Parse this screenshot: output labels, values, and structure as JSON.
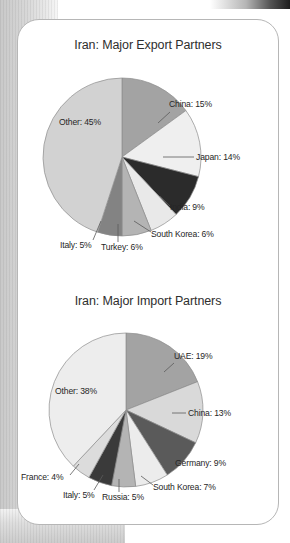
{
  "document": {
    "card_label": "charts-card"
  },
  "charts": [
    {
      "id": "export",
      "title": "Iran: Major Export Partners",
      "chart_data": {
        "type": "pie",
        "title": "Iran: Major Export Partners",
        "xlabel": "",
        "ylabel": "",
        "legend_position": "callout-labels",
        "grid": false,
        "categories": [
          "China",
          "Japan",
          "India",
          "South Korea",
          "Turkey",
          "Italy",
          "Other"
        ],
        "values": [
          15,
          14,
          9,
          6,
          6,
          5,
          45
        ],
        "labels": [
          "China: 15%",
          "Japan: 14%",
          "India: 9%",
          "South Korea: 6%",
          "Turkey: 6%",
          "Italy: 5%",
          "Other: 45%"
        ],
        "colors": [
          "#a3a3a3",
          "#efefef",
          "#2b2b2b",
          "#e9e9e9",
          "#b4b4b4",
          "#838383",
          "#d2d2d2"
        ]
      }
    },
    {
      "id": "import",
      "title": "Iran: Major Import Partners",
      "chart_data": {
        "type": "pie",
        "title": "Iran: Major Import Partners",
        "xlabel": "",
        "ylabel": "",
        "legend_position": "callout-labels",
        "grid": false,
        "categories": [
          "UAE",
          "China",
          "Germany",
          "South Korea",
          "Russia",
          "Italy",
          "France",
          "Other"
        ],
        "values": [
          19,
          13,
          9,
          7,
          5,
          5,
          4,
          38
        ],
        "labels": [
          "UAE: 19%",
          "China: 13%",
          "Germany: 9%",
          "South Korea: 7%",
          "Russia: 5%",
          "Italy: 5%",
          "France: 4%",
          "Other: 38%"
        ],
        "colors": [
          "#a3a3a3",
          "#d9d9d9",
          "#5a5a5a",
          "#ececec",
          "#b4b4b4",
          "#3a3a3a",
          "#dcdcdc",
          "#ededed"
        ]
      }
    }
  ],
  "export_labels": {
    "china": "China: 15%",
    "japan": "Japan: 14%",
    "india": "India: 9%",
    "south_korea": "South Korea: 6%",
    "turkey": "Turkey: 6%",
    "italy": "Italy: 5%",
    "other": "Other: 45%"
  },
  "import_labels": {
    "uae": "UAE: 19%",
    "china": "China: 13%",
    "germany": "Germany: 9%",
    "south_korea": "South Korea: 7%",
    "russia": "Russia: 5%",
    "italy": "Italy: 5%",
    "france": "France: 4%",
    "other": "Other: 38%"
  }
}
